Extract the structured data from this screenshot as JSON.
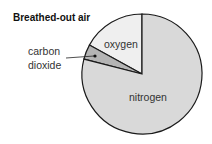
{
  "chart_data": {
    "type": "pie",
    "title": "Breathed-out air",
    "slices": [
      {
        "label": "oxygen",
        "value": 17,
        "color": "#efefef"
      },
      {
        "label": "carbon dioxide",
        "value": 4,
        "color": "#b4b4b4"
      },
      {
        "label": "nitrogen",
        "value": 79,
        "color": "#d9d9d9"
      }
    ],
    "start_angle": "12 o'clock, counter-clockwise",
    "legend": "none (inline labels)"
  },
  "labels": {
    "title": "Breathed-out air",
    "oxygen": "oxygen",
    "carbon_line1": "carbon",
    "carbon_line2": "dioxide",
    "nitrogen": "nitrogen"
  }
}
